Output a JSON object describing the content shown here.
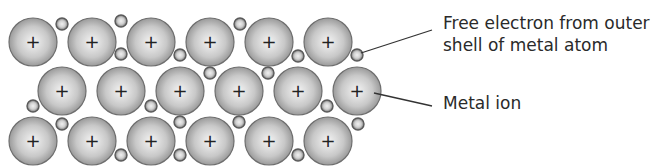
{
  "diagram": {
    "ion_symbol": "+",
    "colors": {
      "ion_edge": "#6e6e6e",
      "ion_fill_center": "#f2f2f2",
      "ion_fill_edge": "#9a9a9a",
      "electron_edge": "#5a5a5a",
      "text": "#2a2a2a",
      "leader_line": "#333333"
    },
    "ion_radius": 24,
    "electron_radius": 6,
    "ions": [
      {
        "x": 33,
        "y": 42
      },
      {
        "x": 92,
        "y": 42
      },
      {
        "x": 151,
        "y": 42
      },
      {
        "x": 210,
        "y": 42
      },
      {
        "x": 269,
        "y": 42
      },
      {
        "x": 328,
        "y": 42
      },
      {
        "x": 62,
        "y": 91
      },
      {
        "x": 121,
        "y": 91
      },
      {
        "x": 180,
        "y": 91
      },
      {
        "x": 239,
        "y": 91
      },
      {
        "x": 298,
        "y": 91
      },
      {
        "x": 357,
        "y": 91
      },
      {
        "x": 33,
        "y": 141
      },
      {
        "x": 92,
        "y": 141
      },
      {
        "x": 151,
        "y": 141
      },
      {
        "x": 210,
        "y": 141
      },
      {
        "x": 269,
        "y": 141
      },
      {
        "x": 328,
        "y": 141
      }
    ],
    "electrons": [
      {
        "x": 62,
        "y": 24
      },
      {
        "x": 121,
        "y": 21
      },
      {
        "x": 121,
        "y": 54
      },
      {
        "x": 180,
        "y": 55
      },
      {
        "x": 240,
        "y": 24
      },
      {
        "x": 298,
        "y": 56
      },
      {
        "x": 357,
        "y": 55
      },
      {
        "x": 210,
        "y": 73
      },
      {
        "x": 268,
        "y": 73
      },
      {
        "x": 33,
        "y": 106
      },
      {
        "x": 151,
        "y": 106
      },
      {
        "x": 327,
        "y": 106
      },
      {
        "x": 62,
        "y": 124
      },
      {
        "x": 180,
        "y": 122
      },
      {
        "x": 239,
        "y": 122
      },
      {
        "x": 358,
        "y": 124
      },
      {
        "x": 121,
        "y": 155
      },
      {
        "x": 180,
        "y": 155
      },
      {
        "x": 298,
        "y": 155
      }
    ],
    "labels": [
      {
        "id": "free-electron",
        "lines": [
          "Free electron from outer",
          "shell of metal atom"
        ],
        "x": 443,
        "y": 12,
        "leader": {
          "x1": 361,
          "y1": 53,
          "x2": 432,
          "y2": 30
        }
      },
      {
        "id": "metal-ion",
        "lines": [
          "Metal ion"
        ],
        "x": 443,
        "y": 92,
        "leader": {
          "x1": 374,
          "y1": 93,
          "x2": 432,
          "y2": 106
        }
      }
    ]
  }
}
